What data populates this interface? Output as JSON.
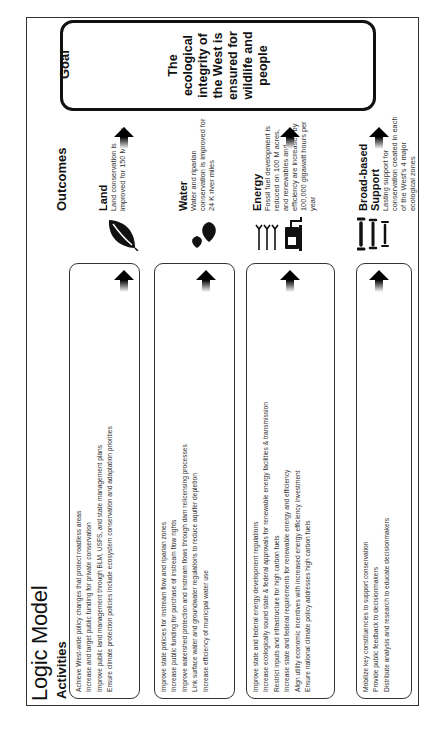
{
  "title": "Logic Model",
  "headers": {
    "activities": "Activities",
    "outcomes": "Outcomes",
    "goal": "Goal"
  },
  "rows": [
    {
      "key": "land",
      "activities": [
        "Achieve West-wide policy changes that protect roadless areas",
        "Increase and target public funding for private conservation",
        "Improve public land management through BLM, USFS, and state management plans",
        "Ensure climate protection policies include ecosystem conservation and adaptation priorities"
      ],
      "icon": "leaf-icon",
      "outcome_title": "Land",
      "outcome_text": "Land conservation is improved for 150 M acres"
    },
    {
      "key": "water",
      "activities": [
        "Improve state policies for instream flow and riparian zones",
        "Increase public funding for purchase of instream flow rights",
        "Improve watershed protection and instream flows through dam relicensing processes",
        "Link surface water and groundwater regulations to reduce aquifer depletion",
        "Increase efficiency of municipal water use"
      ],
      "icon": "water-drops-icon",
      "outcome_title": "Water",
      "outcome_text": "Water and riparian conservation is improved for 24 K river miles"
    },
    {
      "key": "energy",
      "activities": [
        "Improve state and federal energy development regulations",
        "Increase ecologically sound state & federal approvals for renewable energy facilities & transmission",
        "Restrict inputs and infrastructure for high carbon fuels",
        "Increase state and federal requirements for renewable energy and efficiency",
        "Align utility economic incentives with increased energy efficiency investment",
        "Ensure national climate policy addresses high carbon fuels"
      ],
      "icon": "wind-turbine-fuel-pump-icon",
      "outcome_title": "Energy",
      "outcome_text": "Fossil fuel development is reduced on 100 M acres, and renewables and efficiency are increased by 100,000 gigawatt hours per year"
    },
    {
      "key": "support",
      "activities": [
        "Mobilize key constituencies to support conservation",
        "Provide public feedback to decisionmakers",
        "Distribute analysis and research to educate decisionmakers"
      ],
      "icon": "pillars-icon",
      "outcome_title": "Broad-based Support",
      "outcome_text": "Lasting support for conservation created in each of the West's 4 major ecological zones"
    }
  ],
  "goal": {
    "text": "The ecological integrity of the West is ensured for wildlife and people"
  },
  "colors": {
    "border": "#333333",
    "text": "#111111",
    "muted_text": "#333333"
  }
}
